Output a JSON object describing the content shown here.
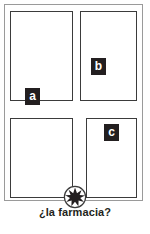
{
  "figure": {
    "type": "street-map-diagram",
    "caption": "¿la farmacia?",
    "frame_color": "#9a9a9a",
    "block_outline_color": "#3b3b3b",
    "marker_color": "#231f20",
    "background_color": "#ffffff"
  },
  "blocks": [
    {
      "id": "block-nw",
      "name": "northwest-block"
    },
    {
      "id": "block-ne",
      "name": "northeast-block"
    },
    {
      "id": "block-sw",
      "name": "southwest-block"
    },
    {
      "id": "block-se",
      "name": "southeast-block"
    }
  ],
  "markers": [
    {
      "id": "a",
      "label": "a"
    },
    {
      "id": "b",
      "label": "b"
    },
    {
      "id": "c",
      "label": "c"
    }
  ],
  "destination": {
    "icon": "starburst-icon",
    "label": "¿la farmacia?"
  }
}
